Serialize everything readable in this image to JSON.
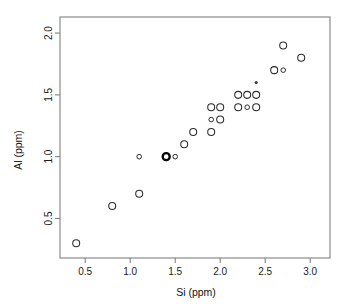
{
  "chart_data": {
    "type": "scatter",
    "title": "",
    "xlabel": "Si (ppm)",
    "ylabel": "Al (ppm)",
    "xlim": [
      0.22,
      3.22
    ],
    "ylim": [
      0.18,
      2.13
    ],
    "xticks": [
      0.5,
      1.0,
      1.5,
      2.0,
      2.5,
      3.0
    ],
    "xticklabels": [
      "0.5",
      "1.0",
      "1.5",
      "2.0",
      "2.5",
      "3.0"
    ],
    "yticks": [
      0.5,
      1.0,
      1.5,
      2.0
    ],
    "yticklabels": [
      "0.5",
      "1.0",
      "1.5",
      "2.0"
    ],
    "grid": false,
    "legend": null,
    "marker_shape": "open-circle",
    "points": [
      {
        "x": 0.4,
        "y": 0.3,
        "size": "medium",
        "style": "open"
      },
      {
        "x": 0.8,
        "y": 0.6,
        "size": "medium",
        "style": "open"
      },
      {
        "x": 1.1,
        "y": 0.7,
        "size": "medium",
        "style": "open"
      },
      {
        "x": 1.1,
        "y": 1.0,
        "size": "small",
        "style": "open"
      },
      {
        "x": 1.4,
        "y": 1.0,
        "size": "medium",
        "style": "bold"
      },
      {
        "x": 1.5,
        "y": 1.0,
        "size": "small",
        "style": "open"
      },
      {
        "x": 1.6,
        "y": 1.1,
        "size": "medium",
        "style": "open"
      },
      {
        "x": 1.7,
        "y": 1.2,
        "size": "medium",
        "style": "open"
      },
      {
        "x": 1.9,
        "y": 1.2,
        "size": "medium",
        "style": "open"
      },
      {
        "x": 1.9,
        "y": 1.3,
        "size": "small",
        "style": "open"
      },
      {
        "x": 2.0,
        "y": 1.3,
        "size": "medium",
        "style": "open"
      },
      {
        "x": 1.9,
        "y": 1.4,
        "size": "medium",
        "style": "open"
      },
      {
        "x": 2.0,
        "y": 1.4,
        "size": "medium",
        "style": "open"
      },
      {
        "x": 2.2,
        "y": 1.4,
        "size": "medium",
        "style": "open"
      },
      {
        "x": 2.3,
        "y": 1.4,
        "size": "small",
        "style": "open"
      },
      {
        "x": 2.4,
        "y": 1.4,
        "size": "medium",
        "style": "open"
      },
      {
        "x": 2.2,
        "y": 1.5,
        "size": "medium",
        "style": "open"
      },
      {
        "x": 2.3,
        "y": 1.5,
        "size": "medium",
        "style": "open"
      },
      {
        "x": 2.4,
        "y": 1.5,
        "size": "medium",
        "style": "open"
      },
      {
        "x": 2.4,
        "y": 1.6,
        "size": "tiny",
        "style": "filled"
      },
      {
        "x": 2.6,
        "y": 1.7,
        "size": "medium",
        "style": "open"
      },
      {
        "x": 2.7,
        "y": 1.7,
        "size": "small",
        "style": "open"
      },
      {
        "x": 2.7,
        "y": 1.9,
        "size": "medium",
        "style": "open"
      },
      {
        "x": 2.9,
        "y": 1.8,
        "size": "medium",
        "style": "open"
      }
    ]
  },
  "axes": {
    "x_title": "Si (ppm)",
    "y_title": "Al (ppm)"
  },
  "colors": {
    "marker_stroke": "#2b2b2b",
    "axis": "#808080",
    "text": "#111111",
    "background": "#ffffff"
  }
}
